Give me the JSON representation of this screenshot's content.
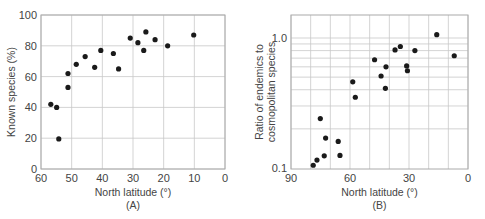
{
  "chart_data": [
    {
      "type": "scatter",
      "panel": "(A)",
      "title": "",
      "xlabel": "North latitude (°)",
      "ylabel": "Known species (%)",
      "xlim": [
        60,
        0
      ],
      "ylim": [
        0,
        100
      ],
      "xticks": [
        60,
        50,
        40,
        30,
        20,
        10,
        0
      ],
      "yticks": [
        0,
        20,
        40,
        60,
        80,
        100
      ],
      "grid": true,
      "points": [
        {
          "x": 56.8,
          "y": 42
        },
        {
          "x": 54.9,
          "y": 40
        },
        {
          "x": 54.2,
          "y": 19.5
        },
        {
          "x": 51.2,
          "y": 62
        },
        {
          "x": 51.2,
          "y": 53
        },
        {
          "x": 48.5,
          "y": 68
        },
        {
          "x": 45.6,
          "y": 73
        },
        {
          "x": 42.5,
          "y": 66
        },
        {
          "x": 40.5,
          "y": 77
        },
        {
          "x": 36.4,
          "y": 75
        },
        {
          "x": 34.7,
          "y": 65
        },
        {
          "x": 30.9,
          "y": 85
        },
        {
          "x": 28.4,
          "y": 82
        },
        {
          "x": 25.8,
          "y": 89
        },
        {
          "x": 26.5,
          "y": 77
        },
        {
          "x": 22.8,
          "y": 84
        },
        {
          "x": 18.7,
          "y": 80
        },
        {
          "x": 10.2,
          "y": 87
        }
      ]
    },
    {
      "type": "scatter",
      "panel": "(B)",
      "title": "",
      "xlabel": "North latitude (°)",
      "ylabel": "Ratio of endemics to cosmopolitan species",
      "ylabel_lines": [
        "Ratio of endemics to",
        "cosmopolitan species"
      ],
      "yscale": "log",
      "xlim": [
        90,
        0
      ],
      "ylim": [
        0.1,
        1.3
      ],
      "xticks": [
        90,
        60,
        30,
        0
      ],
      "xgrid_step": 10,
      "yticks": [
        0.1,
        1.0
      ],
      "ytick_labels": [
        "0.1",
        "1.0"
      ],
      "ygrid": [
        0.2,
        0.3,
        0.4,
        0.5,
        0.6,
        0.7,
        0.8,
        0.9,
        1.0
      ],
      "grid": true,
      "points": [
        {
          "x": 78.7,
          "y": 0.105
        },
        {
          "x": 76.8,
          "y": 0.115
        },
        {
          "x": 73.1,
          "y": 0.124
        },
        {
          "x": 75.1,
          "y": 0.24
        },
        {
          "x": 72.4,
          "y": 0.17
        },
        {
          "x": 66.0,
          "y": 0.16
        },
        {
          "x": 65.1,
          "y": 0.125
        },
        {
          "x": 58.6,
          "y": 0.46
        },
        {
          "x": 57.3,
          "y": 0.35
        },
        {
          "x": 47.5,
          "y": 0.68
        },
        {
          "x": 44.2,
          "y": 0.51
        },
        {
          "x": 42.0,
          "y": 0.41
        },
        {
          "x": 41.7,
          "y": 0.6
        },
        {
          "x": 37.1,
          "y": 0.81
        },
        {
          "x": 34.4,
          "y": 0.86
        },
        {
          "x": 31.2,
          "y": 0.61
        },
        {
          "x": 30.8,
          "y": 0.56
        },
        {
          "x": 27.0,
          "y": 0.8
        },
        {
          "x": 15.9,
          "y": 1.06
        },
        {
          "x": 7.0,
          "y": 0.73
        }
      ]
    }
  ]
}
